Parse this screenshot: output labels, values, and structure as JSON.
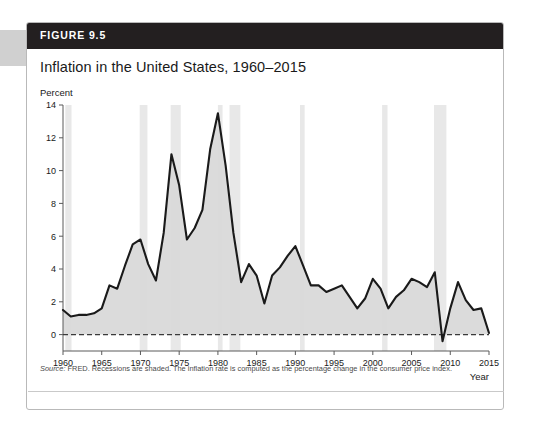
{
  "figure": {
    "header_label": "FIGURE 9.5",
    "title": "Inflation in the United States, 1960–2015",
    "note_source_word": "Source:",
    "note_text": " FRED. Recessions are shaded. The inflation rate is computed as the percentage change in the consumer price index."
  },
  "colors": {
    "header_bg": "#231f20",
    "header_text": "#ffffff",
    "line": "#1a1a1a",
    "area_fill": "#d9d9d9",
    "recession_band": "#e8e8e8",
    "axis": "#5a5a5a",
    "zero_line": "#3a3a3a",
    "card_border": "#b9b9b9",
    "note_text": "#4a4a4a"
  },
  "chart_data": {
    "type": "line",
    "title": "Inflation in the United States, 1960–2015",
    "subtitle": "",
    "xlabel": "Year",
    "ylabel": "Percent",
    "xlim": [
      1960,
      2015
    ],
    "ylim": [
      -1,
      14
    ],
    "grid": false,
    "legend": null,
    "y_ticks": [
      0,
      2,
      4,
      6,
      8,
      10,
      12,
      14
    ],
    "y_tick_labels": [
      "0",
      "2",
      "4",
      "6",
      "8",
      "10",
      "12",
      "14"
    ],
    "x_ticks": [
      1960,
      1965,
      1970,
      1975,
      1980,
      1985,
      1990,
      1995,
      2000,
      2005,
      2010,
      2015
    ],
    "x_tick_labels": [
      "1960",
      "1965",
      "1970",
      "1975",
      "1980",
      "1985",
      "1990",
      "1995",
      "2000",
      "2005",
      "2010",
      "2015"
    ],
    "zero_line": 0,
    "zero_line_style": "dashed",
    "fill_to_zero": true,
    "annotations": [
      "Recessions are shaded"
    ],
    "series": [
      {
        "name": "Inflation rate (CPI, percent change)",
        "x": [
          1960,
          1961,
          1962,
          1963,
          1964,
          1965,
          1966,
          1967,
          1968,
          1969,
          1970,
          1971,
          1972,
          1973,
          1974,
          1975,
          1976,
          1977,
          1978,
          1979,
          1980,
          1981,
          1982,
          1983,
          1984,
          1985,
          1986,
          1987,
          1988,
          1989,
          1990,
          1991,
          1992,
          1993,
          1994,
          1995,
          1996,
          1997,
          1998,
          1999,
          2000,
          2001,
          2002,
          2003,
          2004,
          2005,
          2006,
          2007,
          2008,
          2009,
          2010,
          2011,
          2012,
          2013,
          2014,
          2015
        ],
        "values": [
          1.5,
          1.1,
          1.2,
          1.2,
          1.3,
          1.6,
          3.0,
          2.8,
          4.2,
          5.5,
          5.8,
          4.3,
          3.3,
          6.2,
          11.0,
          9.1,
          5.8,
          6.5,
          7.6,
          11.3,
          13.5,
          10.3,
          6.2,
          3.2,
          4.3,
          3.6,
          1.9,
          3.6,
          4.1,
          4.8,
          5.4,
          4.2,
          3.0,
          3.0,
          2.6,
          2.8,
          3.0,
          2.3,
          1.6,
          2.2,
          3.4,
          2.8,
          1.6,
          2.3,
          2.7,
          3.4,
          3.2,
          2.9,
          3.8,
          -0.4,
          1.6,
          3.2,
          2.1,
          1.5,
          1.6,
          0.1
        ]
      }
    ],
    "recession_bands": [
      {
        "start": 1960.3,
        "end": 1961.1
      },
      {
        "start": 1969.9,
        "end": 1970.9
      },
      {
        "start": 1973.9,
        "end": 1975.2
      },
      {
        "start": 1980.0,
        "end": 1980.6
      },
      {
        "start": 1981.5,
        "end": 1982.9
      },
      {
        "start": 1990.6,
        "end": 1991.2
      },
      {
        "start": 2001.2,
        "end": 2001.9
      },
      {
        "start": 2007.9,
        "end": 2009.5
      }
    ]
  }
}
